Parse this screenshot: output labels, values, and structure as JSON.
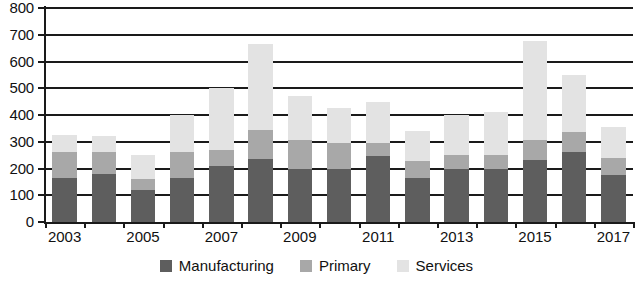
{
  "chart_data": {
    "type": "bar",
    "subtype": "stacked",
    "title": "",
    "xlabel": "",
    "ylabel": "",
    "ylim": [
      0,
      800
    ],
    "ytick_step": 100,
    "yticks": [
      0,
      100,
      200,
      300,
      400,
      500,
      600,
      700,
      800
    ],
    "ytick_labels": [
      "0",
      "100",
      "200",
      "300",
      "400",
      "500",
      "600",
      "700",
      "800"
    ],
    "grid": true,
    "grid_axis": "y",
    "legend_position": "bottom",
    "categories": [
      2003,
      2004,
      2005,
      2006,
      2007,
      2008,
      2009,
      2010,
      2011,
      2012,
      2013,
      2014,
      2015,
      2016,
      2017
    ],
    "xtick_labels": [
      "2003",
      "2005",
      "2007",
      "2009",
      "2011",
      "2013",
      "2015",
      "2017"
    ],
    "xtick_categories": [
      2003,
      2005,
      2007,
      2009,
      2011,
      2013,
      2015,
      2017
    ],
    "series": [
      {
        "name": "Manufacturing",
        "color": "#5e5e5e",
        "values": [
          165,
          180,
          120,
          165,
          210,
          235,
          200,
          200,
          245,
          165,
          200,
          200,
          230,
          260,
          175
        ]
      },
      {
        "name": "Primary",
        "color": "#a8a8a8",
        "values": [
          95,
          80,
          40,
          95,
          60,
          110,
          105,
          95,
          50,
          65,
          50,
          50,
          75,
          75,
          65
        ]
      },
      {
        "name": "Services",
        "color": "#e3e3e3",
        "values": [
          65,
          60,
          90,
          140,
          230,
          320,
          165,
          130,
          155,
          110,
          150,
          160,
          370,
          215,
          115
        ]
      }
    ],
    "totals": [
      325,
      320,
      250,
      400,
      500,
      665,
      470,
      425,
      450,
      340,
      400,
      410,
      675,
      550,
      355
    ]
  },
  "legend": {
    "items": [
      {
        "label": "Manufacturing",
        "swatch": "#5e5e5e"
      },
      {
        "label": "Primary",
        "swatch": "#a8a8a8"
      },
      {
        "label": "Services",
        "swatch": "#e3e3e3"
      }
    ]
  }
}
